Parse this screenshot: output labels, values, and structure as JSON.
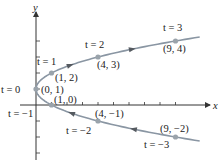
{
  "diagram": {
    "title": "",
    "colors": {
      "axis": "#333333",
      "curve": "#8a96a3",
      "point": "#9aa3ab",
      "arrow": "#555a60",
      "text": "#222222"
    },
    "axes": {
      "x_label": "x",
      "y_label": "y",
      "origin_px": [
        36,
        105
      ],
      "x_unit_px": 15.5,
      "y_unit_px": 16,
      "x_ticks": [
        1,
        2,
        3,
        4,
        5,
        6,
        7,
        8,
        9
      ],
      "y_ticks": [
        -3,
        -2,
        -1,
        1,
        2,
        3,
        4
      ]
    },
    "points": [
      {
        "t": -3,
        "x": 9,
        "y": -2,
        "t_label": "t = −3",
        "coord_label": "(9, −2)"
      },
      {
        "t": -2,
        "x": 4,
        "y": -1,
        "t_label": "t = −2",
        "coord_label": "(4, −1)"
      },
      {
        "t": -1,
        "x": 1,
        "y": 0,
        "t_label": "t = −1",
        "coord_label": "(1, 0)"
      },
      {
        "t": 0,
        "x": 0,
        "y": 1,
        "t_label": "t = 0",
        "coord_label": "(0, 1)"
      },
      {
        "t": 1,
        "x": 1,
        "y": 2,
        "t_label": "t = 1",
        "coord_label": "(1, 2)"
      },
      {
        "t": 2,
        "x": 4,
        "y": 3,
        "t_label": "t = 2",
        "coord_label": "(4, 3)"
      },
      {
        "t": 3,
        "x": 9,
        "y": 4,
        "t_label": "t = 3",
        "coord_label": "(9, 4)"
      }
    ]
  }
}
